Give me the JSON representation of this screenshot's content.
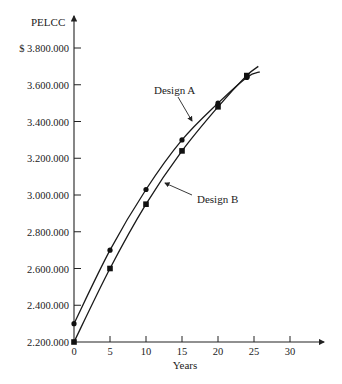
{
  "chart_data": {
    "type": "line",
    "title": "",
    "xlabel": "Years",
    "ylabel": "PELCC",
    "xlim": [
      0,
      34
    ],
    "ylim": [
      2200000,
      3900000
    ],
    "grid": false,
    "x_ticks": [
      0,
      5,
      10,
      15,
      20,
      25,
      30
    ],
    "x_tick_labels": [
      "0",
      "5",
      "10",
      "15",
      "20",
      "25",
      "30"
    ],
    "y_ticks": [
      2200000,
      2400000,
      2600000,
      2800000,
      3000000,
      3200000,
      3400000,
      3600000,
      3800000
    ],
    "y_tick_labels": [
      "2.200.000",
      "2.400.000",
      "2.600.000",
      "2.800.000",
      "3.000.000",
      "3.200.000",
      "3.400.000",
      "3.600.000",
      "$ 3.800.000"
    ],
    "series": [
      {
        "name": "Design A",
        "marker": "circle",
        "points": [
          {
            "x": 0,
            "y": 2300000
          },
          {
            "x": 5,
            "y": 2700000
          },
          {
            "x": 10,
            "y": 3030000
          },
          {
            "x": 15,
            "y": 3300000
          },
          {
            "x": 20,
            "y": 3500000
          },
          {
            "x": 24,
            "y": 3640000
          }
        ],
        "curve_end": {
          "x": 25.8,
          "y": 3670000
        }
      },
      {
        "name": "Design B",
        "marker": "square",
        "points": [
          {
            "x": 0,
            "y": 2200000
          },
          {
            "x": 5,
            "y": 2600000
          },
          {
            "x": 10,
            "y": 2950000
          },
          {
            "x": 15,
            "y": 3240000
          },
          {
            "x": 20,
            "y": 3480000
          },
          {
            "x": 24,
            "y": 3650000
          }
        ],
        "curve_end": {
          "x": 25.6,
          "y": 3700000
        }
      }
    ],
    "annotations": [
      {
        "text": "Design A",
        "points_to": "Design A"
      },
      {
        "text": "Design B",
        "points_to": "Design B"
      }
    ]
  },
  "labels": {
    "y_axis_title": "PELCC",
    "x_axis_title": "Years",
    "design_a": "Design A",
    "design_b": "Design B"
  }
}
